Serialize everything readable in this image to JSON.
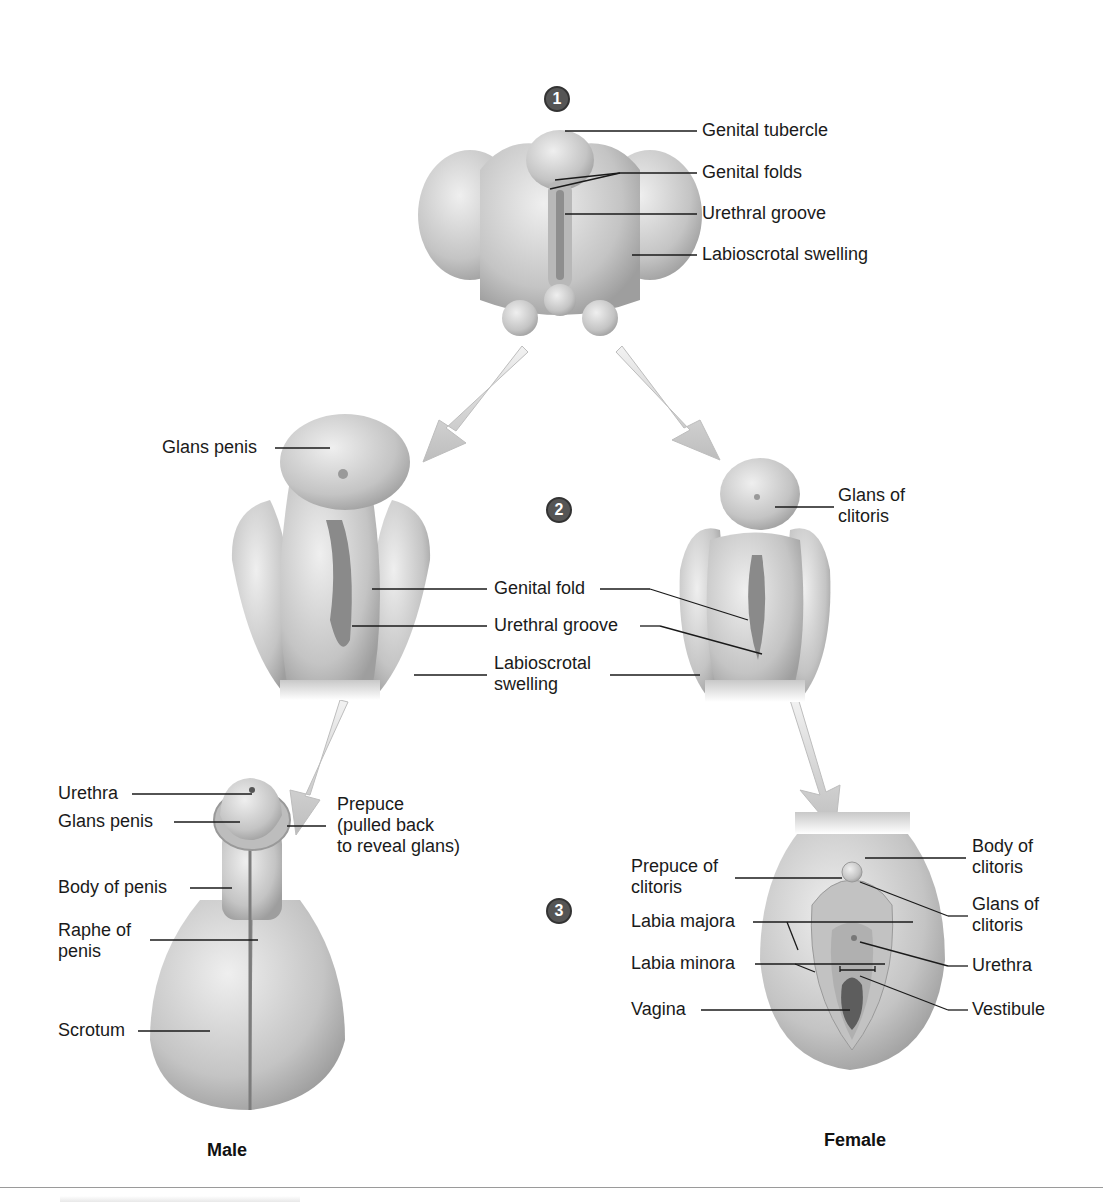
{
  "stages": [
    {
      "number": "1"
    },
    {
      "number": "2"
    },
    {
      "number": "3"
    }
  ],
  "stage1": {
    "labels": [
      "Genital tubercle",
      "Genital folds",
      "Urethral groove",
      "Labioscrotal swelling"
    ]
  },
  "stage2": {
    "male_labels": [
      "Glans penis"
    ],
    "shared_labels": [
      "Genital fold",
      "Urethral groove",
      "Labioscrotal\nswelling"
    ],
    "female_labels": [
      "Glans of\nclitoris"
    ]
  },
  "stage3": {
    "male_labels": [
      "Urethra",
      "Glans penis",
      "Prepuce\n(pulled back\nto reveal glans)",
      "Body of penis",
      "Raphe of\npenis",
      "Scrotum"
    ],
    "female_labels_left": [
      "Prepuce of\nclitoris",
      "Labia majora",
      "Labia minora",
      "Vagina"
    ],
    "female_labels_right": [
      "Body of\nclitoris",
      "Glans of\nclitoris",
      "Urethra",
      "Vestibule"
    ]
  },
  "captions": {
    "male": "Male",
    "female": "Female"
  },
  "colors": {
    "tissue": "#cfcfcf",
    "tissue_dark": "#9c9c9c",
    "arrow": "#c8c8c8",
    "badge": "#555555",
    "leader": "#1a1a1a"
  }
}
